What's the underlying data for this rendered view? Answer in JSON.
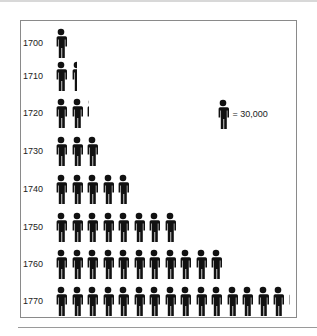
{
  "chart_data": {
    "type": "pictograph",
    "title": "",
    "xlabel": "",
    "ylabel": "",
    "unit_label": "= 30,000",
    "unit_value": 30000,
    "categories": [
      "1700",
      "1710",
      "1720",
      "1730",
      "1740",
      "1750",
      "1760",
      "1770"
    ],
    "icon_counts": [
      1,
      1.5,
      2.25,
      3,
      5,
      8,
      11,
      15.2
    ],
    "values": [
      30000,
      45000,
      67500,
      90000,
      150000,
      240000,
      330000,
      456000
    ]
  },
  "rows": [
    {
      "year": "1700",
      "count": 1
    },
    {
      "year": "1710",
      "count": 1.5
    },
    {
      "year": "1720",
      "count": 2.25
    },
    {
      "year": "1730",
      "count": 3
    },
    {
      "year": "1740",
      "count": 5
    },
    {
      "year": "1750",
      "count": 8
    },
    {
      "year": "1760",
      "count": 11
    },
    {
      "year": "1770",
      "count": 15.2
    }
  ],
  "legend": {
    "icon": "person-icon",
    "label": "= 30,000"
  },
  "colors": {
    "icon": "#111111",
    "frame": "#8a8a8a",
    "text": "#222222"
  }
}
